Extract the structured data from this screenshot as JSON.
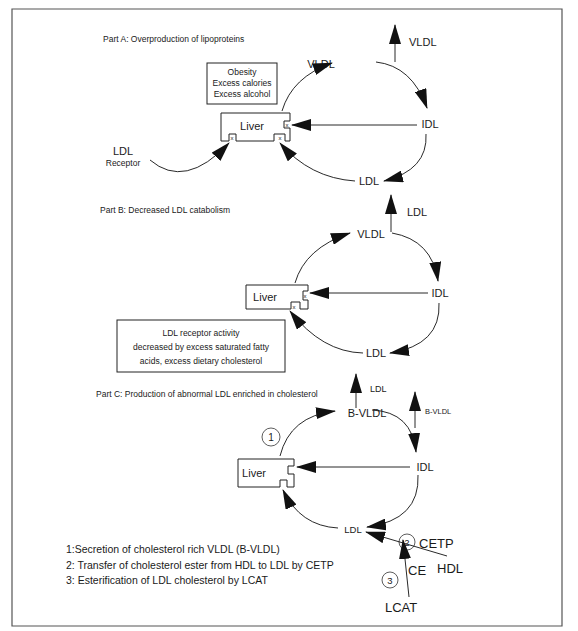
{
  "diagram": {
    "parts": [
      {
        "title": "Part A:  Overproduction of lipoproteins",
        "liver_label": "Liver",
        "cause_box": [
          "Obesity",
          "Excess calories",
          "Excess alcohol"
        ],
        "nodes": {
          "top": "VLDL",
          "right": "IDL",
          "bottom": "LDL",
          "export": "VLDL"
        },
        "receptor_label": [
          "LDL",
          "Receptor"
        ],
        "receptor_mark": "x"
      },
      {
        "title": "Part B:  Decreased LDL catabolism",
        "liver_label": "Liver",
        "nodes": {
          "top": "VLDL",
          "right": "IDL",
          "bottom": "LDL",
          "export": "LDL"
        },
        "note_box": [
          "LDL receptor activity",
          "decreased by excess saturated fatty",
          "acids, excess dietary cholesterol"
        ],
        "receptor_mark": "x"
      },
      {
        "title": "Part C:  Production of abnormal LDL enriched in cholesterol",
        "liver_label": "Liver",
        "nodes": {
          "top": "B-VLDL",
          "right": "IDL",
          "bottom": "LDL",
          "export_top": "LDL",
          "export_right": "B-VLDL"
        },
        "step_markers": [
          "1",
          "2",
          "3"
        ],
        "inputs": {
          "cetp": "CETP",
          "hdl": "HDL",
          "ce": "CE",
          "lcat": "LCAT"
        },
        "legend": [
          "1:Secretion of cholesterol rich VLDL (B-VLDL)",
          "2: Transfer of cholesterol ester from HDL to LDL by CETP",
          "3: Esterification of LDL cholesterol by LCAT"
        ]
      }
    ]
  }
}
